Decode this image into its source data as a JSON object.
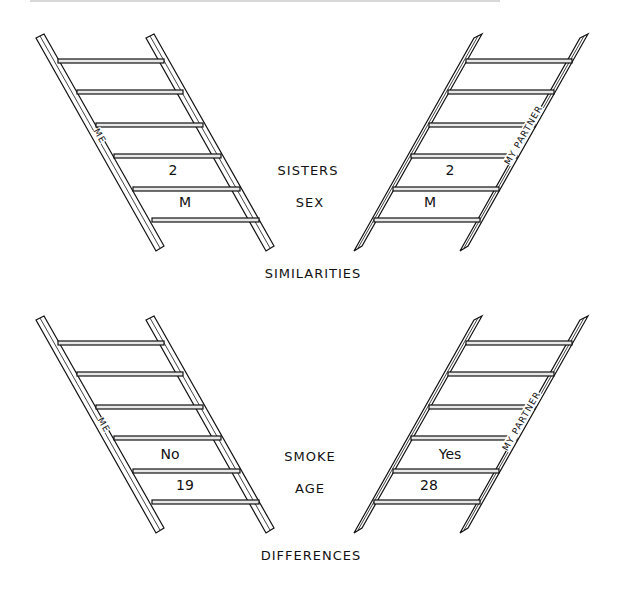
{
  "similarities": {
    "caption": "SIMILARITIES",
    "left_ladder_label": "ME",
    "right_ladder_label": "MY PARTNER",
    "rows": [
      {
        "attribute": "SISTERS",
        "me": "2",
        "partner": "2"
      },
      {
        "attribute": "SEX",
        "me": "M",
        "partner": "M"
      }
    ]
  },
  "differences": {
    "caption": "DIFFERENCES",
    "left_ladder_label": "ME",
    "right_ladder_label": "MY PARTNER",
    "rows": [
      {
        "attribute": "SMOKE",
        "me": "No",
        "partner": "Yes"
      },
      {
        "attribute": "AGE",
        "me": "19",
        "partner": "28"
      }
    ]
  },
  "colors": {
    "ink": "#111111",
    "background": "#ffffff"
  }
}
